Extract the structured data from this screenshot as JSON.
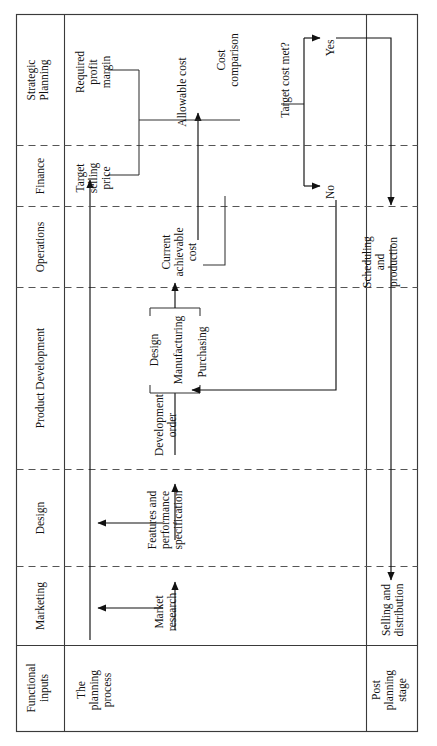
{
  "diagram": {
    "orientation": "rotated-90",
    "colors": {
      "line": "#3a3a3a",
      "dashed": "#555555",
      "flow": "#111111",
      "text": "#111111",
      "background": "#ffffff"
    },
    "lanes": [
      {
        "id": "strategic-planning",
        "label": "Strategic Planning"
      },
      {
        "id": "finance",
        "label": "Finance"
      },
      {
        "id": "operations",
        "label": "Operations"
      },
      {
        "id": "product-development",
        "label": "Product Development"
      },
      {
        "id": "design",
        "label": "Design"
      },
      {
        "id": "marketing",
        "label": "Marketing"
      },
      {
        "id": "functional-inputs",
        "label": "Functional inputs"
      }
    ],
    "columns": [
      {
        "id": "lane-header",
        "label": "Functional inputs"
      },
      {
        "id": "planning-process",
        "label": "The planning process"
      },
      {
        "id": "post-planning",
        "label": "Post planning stage"
      }
    ],
    "stage_labels": {
      "planning_process": "The planning process",
      "post_planning_stage": "Post planning stage"
    },
    "nodes": [
      {
        "id": "required-profit-margin",
        "label": "Required\nprofit\nmargin",
        "lane": "strategic-planning"
      },
      {
        "id": "target-selling-price",
        "label": "Target\nselling\nprice",
        "lane": "finance"
      },
      {
        "id": "allowable-cost",
        "label": "Allowable cost",
        "lane": "strategic-planning"
      },
      {
        "id": "cost-comparison",
        "label": "Cost\ncomparison",
        "lane": "strategic-planning"
      },
      {
        "id": "target-cost-met",
        "label": "Target cost met?",
        "lane": "strategic-planning"
      },
      {
        "id": "yes",
        "label": "Yes",
        "lane": "strategic-planning"
      },
      {
        "id": "no",
        "label": "No",
        "lane": "finance"
      },
      {
        "id": "current-achievable-cost",
        "label": "Current\nachievable\ncost",
        "lane": "operations"
      },
      {
        "id": "scheduling-and-production",
        "label": "Scheduling\nand\nproduction",
        "lane": "operations"
      },
      {
        "id": "design",
        "label": "Design",
        "lane": "product-development"
      },
      {
        "id": "manufacturing",
        "label": "Manufacturing",
        "lane": "product-development"
      },
      {
        "id": "purchasing",
        "label": "Purchasing",
        "lane": "product-development"
      },
      {
        "id": "development-order",
        "label": "Development\norder",
        "lane": "product-development"
      },
      {
        "id": "features-and-performance-specification",
        "label": "Features and\nperformance\nspecification",
        "lane": "design"
      },
      {
        "id": "market-research",
        "label": "Market\nresearch",
        "lane": "marketing"
      },
      {
        "id": "selling-and-distribution",
        "label": "Selling and\ndistribution",
        "lane": "marketing"
      }
    ],
    "node_text": {
      "required_profit_margin": [
        "Required",
        "profit",
        "margin"
      ],
      "target_selling_price": [
        "Target",
        "selling",
        "price"
      ],
      "allowable_cost": [
        "Allowable cost"
      ],
      "cost_comparison": [
        "Cost",
        "comparison"
      ],
      "target_cost_met": [
        "Target cost met?"
      ],
      "yes": [
        "Yes"
      ],
      "no": [
        "No"
      ],
      "current_achievable_cost": [
        "Current",
        "achievable",
        "cost"
      ],
      "scheduling_and_production": [
        "Scheduling",
        "and",
        "production"
      ],
      "design": [
        "Design"
      ],
      "manufacturing": [
        "Manufacturing"
      ],
      "purchasing": [
        "Purchasing"
      ],
      "development_order": [
        "Development",
        "order"
      ],
      "features_and_performance_specification": [
        "Features and",
        "performance",
        "specification"
      ],
      "market_research": [
        "Market",
        "research"
      ],
      "selling_and_distribution": [
        "Selling and",
        "distribution"
      ],
      "the_planning_process": [
        "The",
        "planning",
        "process"
      ],
      "post_planning_stage": [
        "Post",
        "planning",
        "stage"
      ],
      "strategic_planning": [
        "Strategic",
        "Planning"
      ],
      "finance": [
        "Finance"
      ],
      "operations": [
        "Operations"
      ],
      "product_development": [
        "Product Development"
      ],
      "design_lane": [
        "Design"
      ],
      "marketing": [
        "Marketing"
      ],
      "functional_inputs": [
        "Functional",
        "inputs"
      ]
    },
    "flows": [
      {
        "from": "market-research",
        "to": "features-and-performance-specification"
      },
      {
        "from": "features-and-performance-specification",
        "to": "development-order"
      },
      {
        "from": "development-order",
        "to": "design-manufacturing-purchasing"
      },
      {
        "from": "design-manufacturing-purchasing",
        "to": "current-achievable-cost"
      },
      {
        "from": "current-achievable-cost",
        "to": "cost-comparison"
      },
      {
        "from": "required-profit-margin",
        "to": "allowable-cost"
      },
      {
        "from": "target-selling-price",
        "to": "allowable-cost"
      },
      {
        "from": "allowable-cost",
        "to": "cost-comparison"
      },
      {
        "from": "cost-comparison",
        "to": "target-cost-met"
      },
      {
        "from": "target-cost-met",
        "to": "yes"
      },
      {
        "from": "target-cost-met",
        "to": "no"
      },
      {
        "from": "no",
        "to": "design-manufacturing-purchasing"
      },
      {
        "from": "yes",
        "to": "scheduling-and-production"
      },
      {
        "from": "scheduling-and-production",
        "to": "selling-and-distribution"
      }
    ]
  }
}
